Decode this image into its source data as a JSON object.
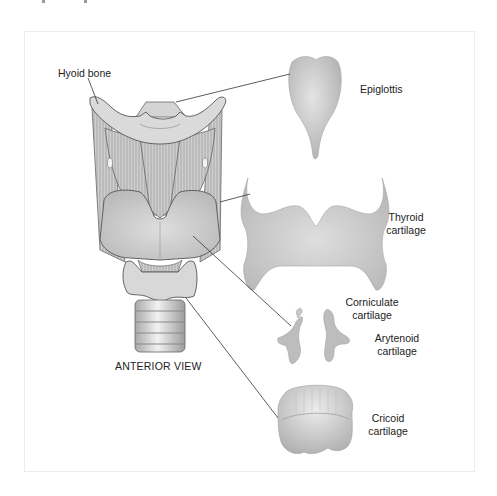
{
  "figure": {
    "caption": "ANTERIOR VIEW",
    "labels": {
      "hyoid_bone": "Hyoid bone",
      "epiglottis": "Epiglottis",
      "thyroid_line1": "Thyroid",
      "thyroid_line2": "cartilage",
      "corniculate_line1": "Corniculate",
      "corniculate_line2": "cartilage",
      "arytenoid_line1": "Arytenoid",
      "arytenoid_line2": "cartilage",
      "cricoid_line1": "Cricoid",
      "cricoid_line2": "cartilage"
    },
    "colors": {
      "cartilage_fill": "#c9c9c9",
      "cartilage_light": "#e2e2e2",
      "outline": "#555555",
      "leader_line": "#333333",
      "text": "#222222"
    }
  }
}
